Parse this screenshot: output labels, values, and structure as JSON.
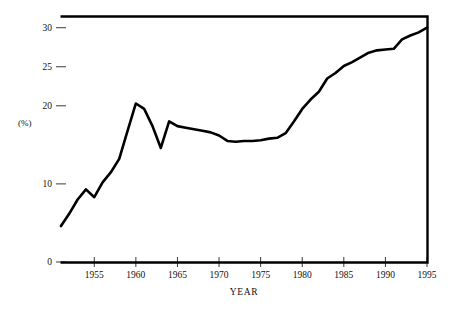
{
  "figure": {
    "background_color": "#ffffff",
    "line_color": "#000000",
    "axis_color": "#000000"
  },
  "labels": {
    "y_caption": "(%)",
    "x_title": "YEAR"
  },
  "chart_data": {
    "type": "line",
    "title": "",
    "subtitle": "",
    "xlabel": "YEAR",
    "ylabel": "(%)",
    "xlim": [
      1951,
      1995
    ],
    "ylim": [
      0,
      31.5
    ],
    "grid": false,
    "legend": null,
    "legend_position": "none",
    "x_ticks": [
      1955,
      1960,
      1965,
      1970,
      1975,
      1980,
      1985,
      1990,
      1995
    ],
    "x_tick_labels": [
      "1955",
      "1960",
      "1965",
      "1970",
      "1975",
      "1980",
      "1985",
      "1990",
      "1995"
    ],
    "y_ticks": [
      0,
      10,
      20,
      25,
      30
    ],
    "y_tick_labels": [
      "0",
      "10",
      "20",
      "25",
      "30"
    ],
    "series": [
      {
        "name": "percent",
        "x": [
          1951,
          1952,
          1953,
          1954,
          1955,
          1956,
          1957,
          1958,
          1959,
          1960,
          1961,
          1962,
          1963,
          1964,
          1965,
          1966,
          1967,
          1968,
          1969,
          1970,
          1971,
          1972,
          1973,
          1974,
          1975,
          1976,
          1977,
          1978,
          1979,
          1980,
          1981,
          1982,
          1983,
          1984,
          1985,
          1986,
          1987,
          1988,
          1989,
          1990,
          1991,
          1992,
          1993,
          1994,
          1995
        ],
        "values": [
          4.6,
          6.2,
          8.0,
          9.3,
          8.3,
          10.2,
          11.5,
          13.2,
          16.8,
          20.3,
          19.6,
          17.4,
          14.6,
          18.0,
          17.4,
          17.2,
          17.0,
          16.8,
          16.6,
          16.2,
          15.5,
          15.4,
          15.5,
          15.5,
          15.6,
          15.8,
          15.9,
          16.5,
          18.0,
          19.6,
          20.8,
          21.8,
          23.5,
          24.2,
          25.1,
          25.6,
          26.2,
          26.8,
          27.1,
          27.2,
          27.3,
          28.5,
          29.0,
          29.4,
          30.0
        ]
      }
    ]
  }
}
